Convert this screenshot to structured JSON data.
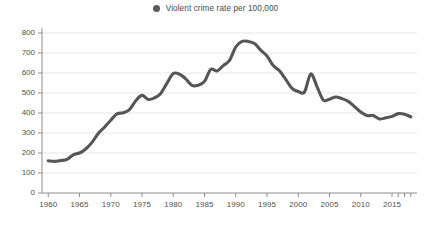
{
  "legend": {
    "position": "top-center",
    "entries": [
      {
        "label": "Violent crime rate per 100,000",
        "color": "#5a5a5a",
        "marker": "circle"
      }
    ]
  },
  "colors": {
    "series": "#565656",
    "gridline": "#e3e3e3",
    "axis": "#8d8d8d",
    "background": "#ffffff",
    "tick_label": "#4f4f4f"
  },
  "chart_data": {
    "type": "line",
    "title": "",
    "subtitle": "",
    "xlabel": "",
    "ylabel": "",
    "xlim": [
      1959,
      2019
    ],
    "ylim": [
      0,
      800
    ],
    "grid": true,
    "legend_position": "top-center",
    "y_ticks": [
      0,
      100,
      200,
      300,
      400,
      500,
      600,
      700,
      800
    ],
    "y_tick_labels": [
      "0",
      "100",
      "200",
      "300",
      "400",
      "500",
      "600",
      "700",
      "800"
    ],
    "x_ticks": [
      1960,
      1965,
      1970,
      1975,
      1980,
      1985,
      1990,
      1995,
      2000,
      2005,
      2010,
      2015
    ],
    "x_tick_labels": [
      "1960",
      "1965",
      "1970",
      "1975",
      "1980",
      "1985",
      "1990",
      "1995",
      "2000",
      "2005",
      "2010",
      "2015"
    ],
    "x_minor_ticks": [
      2016,
      2017,
      2018
    ],
    "series": [
      {
        "name": "Violent crime rate per 100,000",
        "color": "#565656",
        "x": [
          1960,
          1961,
          1962,
          1963,
          1964,
          1965,
          1966,
          1967,
          1968,
          1969,
          1970,
          1971,
          1972,
          1973,
          1974,
          1975,
          1976,
          1977,
          1978,
          1979,
          1980,
          1981,
          1982,
          1983,
          1984,
          1985,
          1986,
          1987,
          1988,
          1989,
          1990,
          1991,
          1992,
          1993,
          1994,
          1995,
          1996,
          1997,
          1998,
          1999,
          2000,
          2001,
          2002,
          2003,
          2004,
          2005,
          2006,
          2007,
          2008,
          2009,
          2010,
          2011,
          2012,
          2013,
          2014,
          2015,
          2016,
          2017,
          2018
        ],
        "values": [
          161,
          158,
          162,
          168,
          191,
          200,
          220,
          253,
          298,
          329,
          364,
          396,
          401,
          417,
          461,
          488,
          468,
          476,
          498,
          549,
          597,
          594,
          571,
          538,
          539,
          558,
          618,
          610,
          637,
          663,
          730,
          758,
          758,
          747,
          714,
          685,
          637,
          611,
          568,
          523,
          507,
          505,
          595,
          532,
          465,
          469,
          480,
          472,
          458,
          432,
          405,
          387,
          387,
          370,
          376,
          383,
          397,
          394,
          381
        ]
      }
    ]
  }
}
